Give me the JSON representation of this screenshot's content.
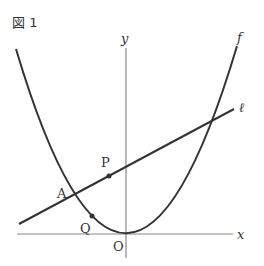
{
  "figure": {
    "title": "図 1"
  },
  "axes": {
    "x_label": "x",
    "y_label": "y",
    "origin_label": "O"
  },
  "curves": {
    "parabola_label": "f",
    "line_label": "ℓ"
  },
  "points": {
    "A": "A",
    "P": "P",
    "Q": "Q"
  },
  "colors": {
    "stroke": "#333333",
    "axis": "#888888"
  }
}
